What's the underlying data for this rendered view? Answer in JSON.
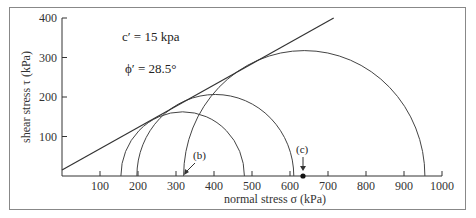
{
  "chart_data": {
    "type": "line",
    "title": "",
    "xlabel": "normal stress σ  (kPa)",
    "ylabel": "shear stress τ  (kPa)",
    "xlim": [
      0,
      1000
    ],
    "ylim": [
      0,
      400
    ],
    "x_ticks": [
      100,
      200,
      300,
      400,
      500,
      600,
      700,
      800,
      900,
      1000
    ],
    "y_ticks": [
      100,
      200,
      300,
      400
    ],
    "grid": false,
    "legend": null,
    "failure_envelope": {
      "name": "Mohr-Coulomb envelope",
      "c_prime_kPa": 15,
      "phi_prime_deg": 28.5,
      "points": [
        [
          0,
          15
        ],
        [
          715,
          400
        ]
      ]
    },
    "mohr_circles": [
      {
        "name": "circle 1",
        "sigma3": 155,
        "sigma1": 480
      },
      {
        "name": "circle 2",
        "sigma3": 197,
        "sigma1": 610
      },
      {
        "name": "circle 3",
        "sigma3": 320,
        "sigma1": 955
      }
    ],
    "annotations": [
      {
        "text": "c′ = 15 kpa",
        "x": 170,
        "y": 355
      },
      {
        "text": "ϕ′ = 28.5°",
        "x": 170,
        "y": 290
      },
      {
        "text": "(b)",
        "x": 360,
        "y": 45,
        "arrow_to": [
          320,
          0
        ]
      },
      {
        "text": "(c)",
        "x": 635,
        "y": 60,
        "arrow_to": [
          635,
          0
        ]
      }
    ],
    "marked_points": [
      {
        "label": "(c)",
        "x": 635,
        "y": 0
      }
    ]
  },
  "labels": {
    "x_axis_title": "normal stress σ   (kPa)",
    "y_axis_title": "shear stress τ   (kPa)",
    "c_annotation": "c′ = 15 kpa",
    "phi_annotation": "ϕ′ = 28.5°",
    "b_label": "(b)",
    "c_label": "(c)",
    "x_ticks": [
      "100",
      "200",
      "300",
      "400",
      "500",
      "600",
      "700",
      "800",
      "900",
      "1000"
    ],
    "y_ticks": [
      "100",
      "200",
      "300",
      "400"
    ]
  }
}
